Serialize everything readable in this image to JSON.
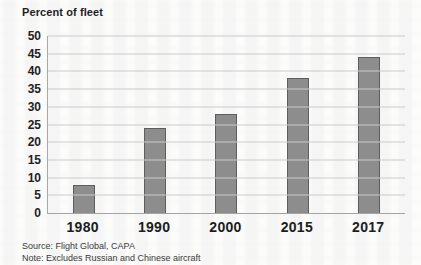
{
  "chart_data": {
    "type": "bar",
    "title": "Percent of fleet",
    "categories": [
      "1980",
      "1990",
      "2000",
      "2015",
      "2017"
    ],
    "values": [
      8,
      24,
      28,
      38,
      44
    ],
    "xlabel": "",
    "ylabel": "Percent of fleet",
    "ylim": [
      0,
      50
    ],
    "yticks": [
      0,
      5,
      10,
      15,
      20,
      25,
      30,
      35,
      40,
      45,
      50
    ],
    "grid": "horizontal",
    "legend": "none",
    "bar_color": "#8d8d8d",
    "bar_border_color": "#5e5e5e"
  },
  "footer": {
    "source": "Source: Flight Global, CAPA",
    "note": "Note: Excludes Russian and Chinese aircraft"
  }
}
